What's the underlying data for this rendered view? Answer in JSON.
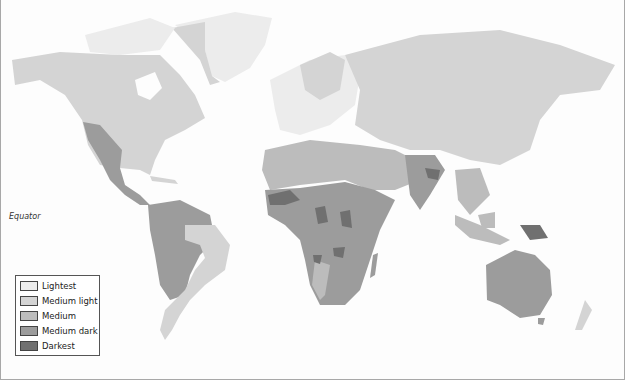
{
  "map": {
    "subject": "World map choropleth, gray scale shading by region",
    "equator_label": "Equator",
    "colors": {
      "lightest": "#ececec",
      "medium_light": "#d4d4d4",
      "medium": "#bcbcbc",
      "medium_dark": "#9c9c9c",
      "darkest": "#707070",
      "ocean": "#fdfdfd",
      "border": "#a8a8a8"
    }
  },
  "legend": {
    "items": [
      {
        "label": "Lightest",
        "color": "#ececec"
      },
      {
        "label": "Medium light",
        "color": "#d4d4d4"
      },
      {
        "label": "Medium",
        "color": "#bcbcbc"
      },
      {
        "label": "Medium dark",
        "color": "#9c9c9c"
      },
      {
        "label": "Darkest",
        "color": "#707070"
      }
    ]
  }
}
